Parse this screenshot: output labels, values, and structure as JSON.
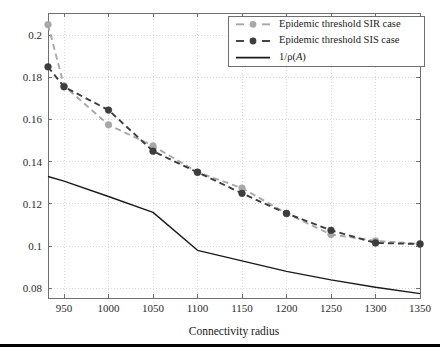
{
  "figure": {
    "background_color": "#ffffff",
    "plot_area": {
      "left": 48,
      "right": 420,
      "top": 13,
      "bottom": 298
    },
    "bottom_rule": {
      "y": 344,
      "height": 3,
      "color": "#000000"
    }
  },
  "axes": {
    "x_title": "Connectivity radius",
    "y_title": "",
    "x_ticks": [
      950,
      1000,
      1050,
      1100,
      1150,
      1200,
      1250,
      1300,
      1350
    ],
    "x_tick_labels": [
      "950",
      "1000",
      "1050",
      "1100",
      "1150",
      "1200",
      "1250",
      "1300",
      "1350"
    ],
    "y_ticks": [
      0.08,
      0.1,
      0.12,
      0.14,
      0.16,
      0.18,
      0.2
    ],
    "y_tick_labels": [
      "0.08",
      "0.1",
      "0.12",
      "0.14",
      "0.16",
      "0.18",
      "0.2"
    ],
    "xlim": [
      932,
      1350
    ],
    "ylim": [
      0.0754,
      0.2105
    ],
    "grid": true,
    "grid_color": "#c9c9c9",
    "frame_color": "#6f6f6f"
  },
  "legend": {
    "position": "top-right",
    "box": {
      "x": 228,
      "y": 16,
      "width": 196,
      "height": 50
    },
    "border_color": "#6f6f6f",
    "entries": [
      {
        "label": "Epidemic threshold SIR case",
        "style": "dashed-marker",
        "color": "#a8a8a8",
        "marker": "circle"
      },
      {
        "label": "Epidemic threshold SIS case",
        "style": "dashed-marker",
        "color": "#3d3d3d",
        "marker": "circle"
      },
      {
        "label_prefix": "1/",
        "label_rho": "ρ",
        "label_paren_open": "(",
        "label_italic": "A",
        "label_paren_close": ")",
        "label": "1/ρ(A)",
        "style": "solid",
        "color": "#1a1a1a",
        "marker": "none"
      }
    ]
  },
  "chart_data": {
    "type": "line",
    "title": "",
    "xlabel": "Connectivity radius",
    "ylabel": "",
    "xlim": [
      932,
      1350
    ],
    "ylim": [
      0.0754,
      0.2105
    ],
    "grid": true,
    "legend_position": "top-right",
    "series": [
      {
        "name": "Epidemic threshold SIR case",
        "color": "#a8a8a8",
        "line_style": "dashed",
        "marker": "circle",
        "x": [
          932,
          950,
          1000,
          1050,
          1100,
          1150,
          1200,
          1250,
          1300,
          1350
        ],
        "values": [
          0.205,
          0.176,
          0.1575,
          0.1475,
          0.135,
          0.1275,
          0.1155,
          0.1055,
          0.1025,
          0.101
        ]
      },
      {
        "name": "Epidemic threshold SIS case",
        "color": "#3d3d3d",
        "line_style": "dashed",
        "marker": "circle",
        "x": [
          932,
          950,
          1000,
          1050,
          1100,
          1150,
          1200,
          1250,
          1300,
          1350
        ],
        "values": [
          0.185,
          0.1755,
          0.1645,
          0.145,
          0.135,
          0.125,
          0.1155,
          0.1075,
          0.1015,
          0.101
        ]
      },
      {
        "name": "1/ρ(A)",
        "color": "#1a1a1a",
        "line_style": "solid",
        "marker": "none",
        "x": [
          932,
          950,
          1000,
          1050,
          1100,
          1150,
          1200,
          1250,
          1300,
          1350
        ],
        "values": [
          0.133,
          0.1308,
          0.1235,
          0.116,
          0.098,
          0.093,
          0.088,
          0.084,
          0.0805,
          0.0775
        ]
      }
    ]
  }
}
